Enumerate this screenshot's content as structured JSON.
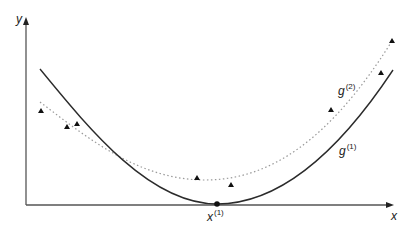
{
  "diagram": {
    "axes": {
      "x_label": "x",
      "y_label": "y",
      "origin": [
        26,
        205
      ],
      "x_end": [
        393,
        205
      ],
      "y_end": [
        26,
        17
      ]
    },
    "curves": [
      {
        "name": "g1",
        "label_base": "g",
        "label_sup": "(1)",
        "style": "solid",
        "color": "#2b2b2b"
      },
      {
        "name": "g2",
        "label_base": "g",
        "label_sup": "(2)",
        "style": "dotted",
        "color": "#9a9a9a"
      }
    ],
    "minimum_point": {
      "label_base": "x",
      "label_sup": "(1)",
      "px": [
        217,
        204
      ]
    },
    "data_points": [
      [
        41,
        111
      ],
      [
        67,
        127
      ],
      [
        77,
        124
      ],
      [
        197,
        178
      ],
      [
        231,
        185
      ],
      [
        331,
        110
      ],
      [
        381,
        73
      ],
      [
        392,
        41
      ]
    ],
    "colors": {
      "axis": "#555555",
      "solid": "#2b2b2b",
      "dotted": "#9a9a9a",
      "marker": "#111111"
    }
  }
}
